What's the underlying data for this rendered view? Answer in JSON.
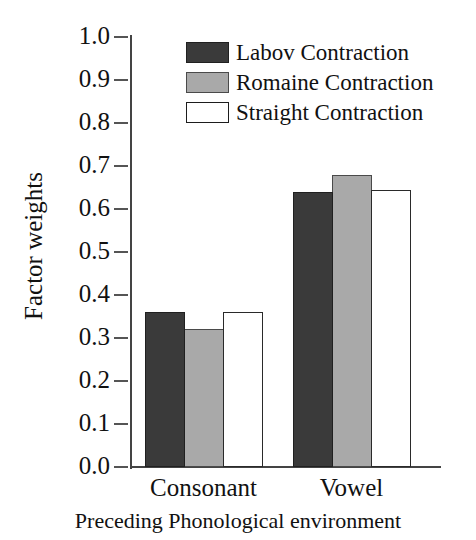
{
  "chart_data": {
    "type": "bar",
    "title": "",
    "xlabel": "Preceding Phonological environment",
    "ylabel": "Factor weights",
    "categories": [
      "Consonant",
      "Vowel"
    ],
    "series": [
      {
        "name": "Labov Contraction",
        "values": [
          0.36,
          0.64
        ],
        "color": "#3a3a3a"
      },
      {
        "name": "Romaine Contraction",
        "values": [
          0.32,
          0.68
        ],
        "color": "#a9a9a9"
      },
      {
        "name": "Straight Contraction",
        "values": [
          0.36,
          0.645
        ],
        "color": "#ffffff"
      }
    ],
    "ylim": [
      0.0,
      1.0
    ],
    "ytick_labels": [
      "1.0",
      "0.9",
      "0.8",
      "0.7",
      "0.6",
      "0.5",
      "0.4",
      "0.3",
      "0.2",
      "0.1",
      "0.0"
    ],
    "ytick_values": [
      1.0,
      0.9,
      0.8,
      0.7,
      0.6,
      0.5,
      0.4,
      0.3,
      0.2,
      0.1,
      0.0
    ],
    "grid": false,
    "legend_position": "top-right",
    "legend_entries": [
      "Labov Contraction",
      "Romaine Contraction",
      "Straight Contraction"
    ]
  }
}
